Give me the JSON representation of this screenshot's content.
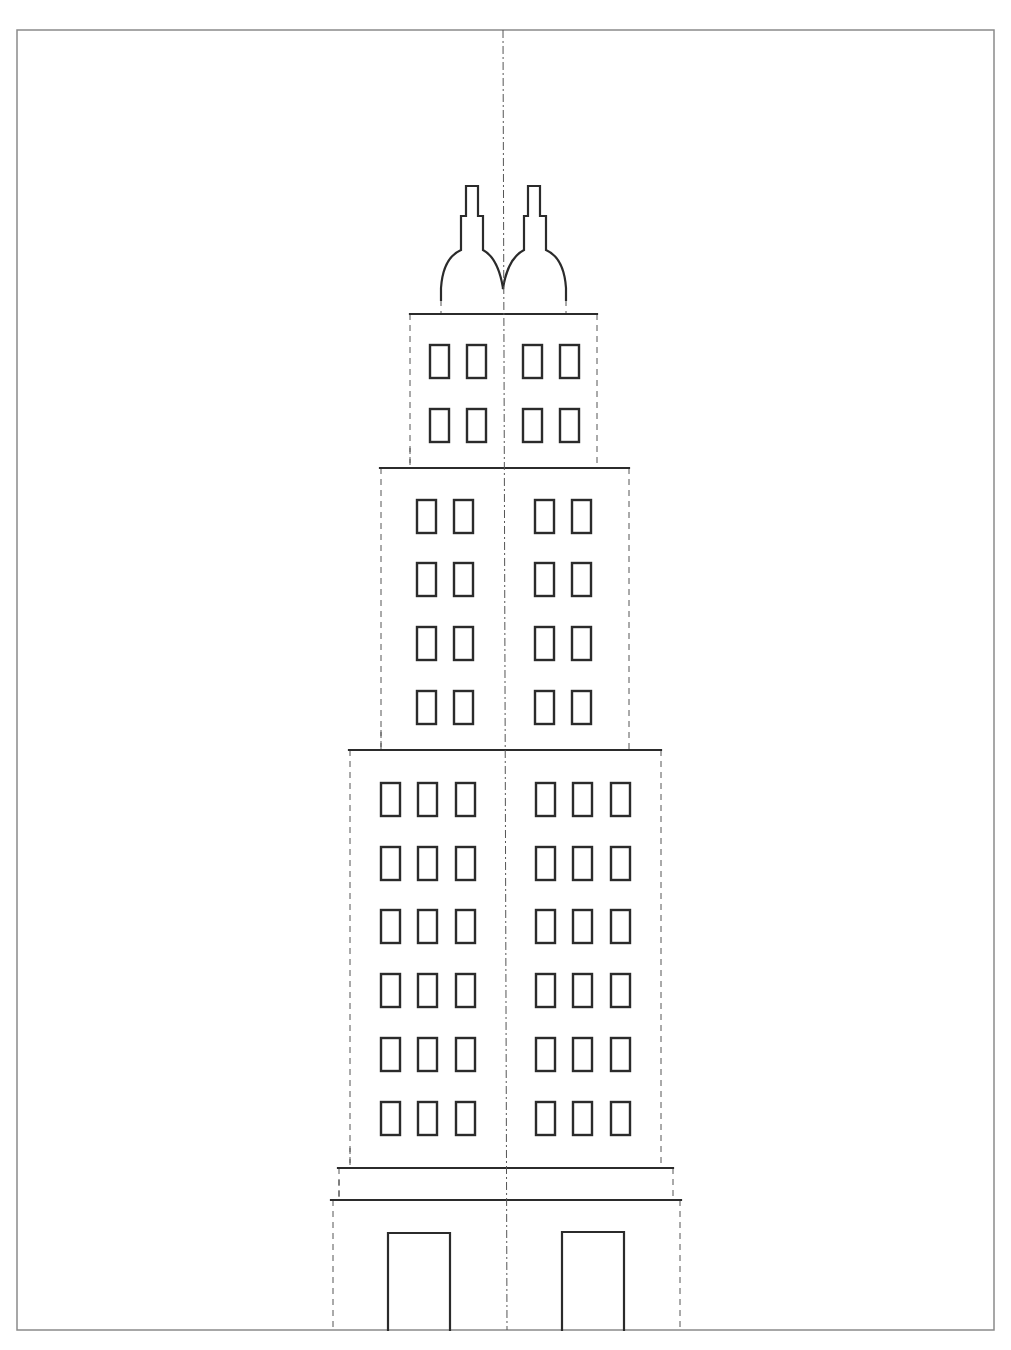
{
  "template": {
    "title": "",
    "frame": {
      "x": 17,
      "y": 30,
      "w": 977,
      "h": 1300
    },
    "colors": {
      "line": "#2b2b2b",
      "fold": "#555555",
      "frame": "#8a8a8a",
      "background": "#ffffff"
    },
    "centerline": {
      "x_top": 503,
      "x_bottom": 507,
      "y1": 30,
      "y2": 1330,
      "style": "dash-dot"
    },
    "spires": {
      "left_path": "M441,300 L441,288 Q443,258 461,250 L461,216 L466,216 L466,186 L478,186 L478,216 L483,216 L483,250 Q498,258 503,288",
      "right_path": "M503,288 Q508,258 524,250 L524,216 L528,216 L528,186 L540,186 L540,216 L546,216 L546,250 Q564,258 566,288 L566,300",
      "base_folds": [
        441,
        566
      ]
    },
    "tiers": [
      {
        "name": "tier-top",
        "top": 314,
        "bottom": 468,
        "left": 410,
        "right": 597,
        "ledge_left": 410,
        "ledge_right": 597
      },
      {
        "name": "tier-upper",
        "top": 468,
        "bottom": 750,
        "left": 381,
        "right": 629,
        "ledge_left": 380,
        "ledge_right": 629
      },
      {
        "name": "tier-main",
        "top": 750,
        "bottom": 1168,
        "left": 350,
        "right": 661,
        "ledge_left": 349,
        "ledge_right": 661
      },
      {
        "name": "tier-plinth",
        "top": 1168,
        "bottom": 1200,
        "left": 339,
        "right": 673,
        "ledge_left": 338,
        "ledge_right": 673
      },
      {
        "name": "tier-base",
        "top": 1200,
        "bottom": 1330,
        "left": 333,
        "right": 680,
        "ledge_left": 331,
        "ledge_right": 681
      }
    ],
    "window_grids": [
      {
        "name": "top-windows",
        "w": 19,
        "h": 33,
        "cols_x": [
          430,
          467,
          523,
          560
        ],
        "rows_y": [
          345,
          409
        ]
      },
      {
        "name": "upper-windows",
        "w": 19,
        "h": 33,
        "cols_x": [
          417,
          454,
          535,
          572
        ],
        "rows_y": [
          500,
          563,
          627,
          691
        ]
      },
      {
        "name": "main-windows",
        "w": 19,
        "h": 33,
        "cols_x": [
          381,
          418,
          456,
          536,
          573,
          611
        ],
        "rows_y": [
          783,
          847,
          910,
          974,
          1038,
          1102
        ]
      }
    ],
    "doors": [
      {
        "name": "door-left",
        "x": 388,
        "y": 1233,
        "w": 62,
        "h": 97
      },
      {
        "name": "door-right",
        "x": 562,
        "y": 1232,
        "w": 62,
        "h": 98
      }
    ],
    "counts": {
      "windows_total": 80,
      "doors": 2,
      "spires": 2,
      "tiers": 5
    }
  }
}
